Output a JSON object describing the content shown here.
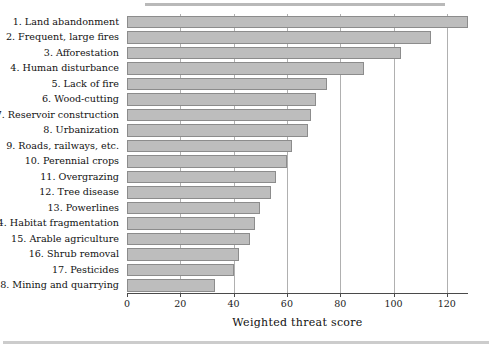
{
  "chart_data": {
    "type": "bar",
    "orientation": "horizontal",
    "title": "",
    "xlabel": "Weighted threat score",
    "ylabel": "",
    "xlim": [
      0,
      128
    ],
    "xticks": [
      0,
      20,
      40,
      60,
      80,
      100,
      120
    ],
    "xticklabels": [
      "0",
      "20",
      "40",
      "60",
      "80",
      "100",
      "120"
    ],
    "grid": "vertical",
    "legend": "none",
    "bar_color": "#bdbdbd",
    "bar_edge_color": "#8c8c8c",
    "categories": [
      "1. Land abandonment",
      "2. Frequent, large fires",
      "3. Afforestation",
      "4. Human disturbance",
      "5. Lack of fire",
      "6. Wood-cutting",
      "7. Reservoir construction",
      "8. Urbanization",
      "9. Roads, railways, etc.",
      "10. Perennial crops",
      "11. Overgrazing",
      "12. Tree disease",
      "13. Powerlines",
      "14. Habitat fragmentation",
      "15. Arable agriculture",
      "16. Shrub removal",
      "17. Pesticides",
      "18. Mining and quarrying"
    ],
    "values": [
      128,
      114,
      103,
      89,
      75,
      71,
      69,
      68,
      62,
      60,
      56,
      54,
      50,
      48,
      46,
      42,
      40,
      33
    ]
  }
}
